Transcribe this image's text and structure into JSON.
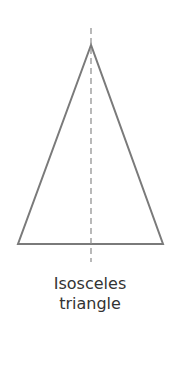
{
  "diagram": {
    "caption_line1": "Isosceles",
    "caption_line2": "triangle",
    "shape": "isosceles-triangle",
    "stroke_color": "#7a7a7a",
    "axis_color": "#8a8a8a",
    "apex": [
      91,
      45
    ],
    "base_left": [
      18,
      244
    ],
    "base_right": [
      163,
      244
    ],
    "axis_top": 28,
    "axis_bottom": 262
  }
}
